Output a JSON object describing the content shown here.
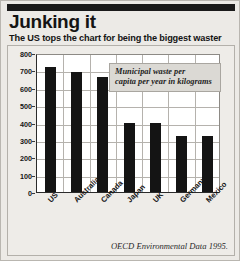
{
  "header": {
    "title": "Junking it",
    "subtitle": "The US tops the chart for being the biggest waster"
  },
  "annotation": {
    "line1": "Municipal waste per",
    "line2": "capita per year in kilograms"
  },
  "source": "OECD Environmental Data 1995.",
  "colors": {
    "bar": "#141414",
    "panel_background": "#eeece8",
    "page_background": "#eceae6",
    "grid": "#b5b2ad",
    "annotation_background": "#dbd9d4",
    "rule": "#1a1a1a"
  },
  "chart_data": {
    "type": "bar",
    "title": "Junking it",
    "subtitle": "The US tops the chart for being the biggest waster",
    "annotation": "Municipal waste per capita per year in kilograms",
    "source": "OECD Environmental Data 1995.",
    "xlabel": "",
    "ylabel": "",
    "categories": [
      "US",
      "Australia",
      "Canada",
      "Japan",
      "UK",
      "Germany",
      "Mexico"
    ],
    "values": [
      720,
      690,
      660,
      400,
      395,
      325,
      320
    ],
    "ylim": [
      0,
      800
    ],
    "yticks": [
      0,
      100,
      200,
      300,
      400,
      500,
      600,
      700,
      800
    ],
    "ytick_labels": [
      "0",
      "100",
      "200",
      "300",
      "400",
      "500",
      "600",
      "700",
      "800"
    ],
    "grid": true,
    "legend": false,
    "units": "kilograms per capita per year"
  }
}
